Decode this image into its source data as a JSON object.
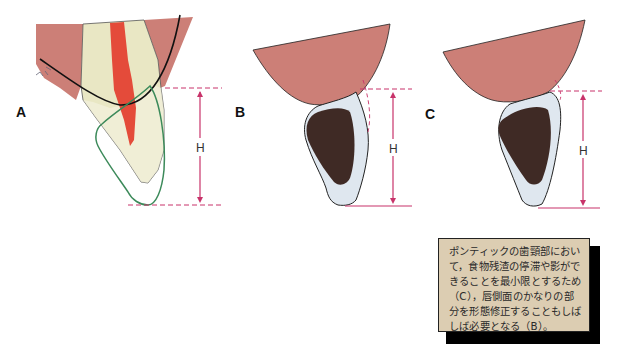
{
  "panels": [
    {
      "id": "A",
      "label": "A",
      "measure_label": "H"
    },
    {
      "id": "B",
      "label": "B",
      "measure_label": "H"
    },
    {
      "id": "C",
      "label": "C",
      "measure_label": "H"
    }
  ],
  "caption": {
    "text": "ポンティックの歯頸部において，食物残渣の停滞や影ができることを最小限とするため（C），唇側面のかなりの部分を形態修正することもしばしば必要となる（B）。"
  },
  "colors": {
    "gingiva": "#cc7f77",
    "tooth": "#e9e7c4",
    "pulp": "#e44b3a",
    "pontic_body": "#3f2a25",
    "pontic_shell": "#dfe7ef",
    "outline_green": "#3c8a5a",
    "dimension": "#c8336a"
  }
}
